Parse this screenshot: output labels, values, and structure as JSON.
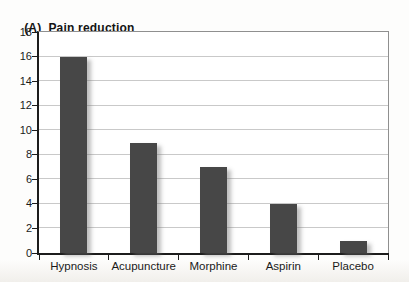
{
  "figure": {
    "panel_label": "(A)",
    "title_text": "Pain reduction"
  },
  "chart_data": {
    "type": "bar",
    "categories": [
      "Hypnosis",
      "Acupuncture",
      "Morphine",
      "Aspirin",
      "Placebo"
    ],
    "values": [
      16,
      9,
      7,
      4,
      1
    ],
    "xlabel": "",
    "ylabel": "",
    "ylim": [
      0,
      18
    ],
    "yticks": [
      0,
      2,
      4,
      6,
      8,
      10,
      12,
      14,
      16,
      18
    ],
    "grid": true,
    "legend": "none",
    "colors": {
      "bar": "#474747",
      "gridline": "#c9c9c9",
      "axis": "#1c1c1c",
      "plot_border": "#8f8f8f",
      "text": "#1a1a1a"
    }
  }
}
